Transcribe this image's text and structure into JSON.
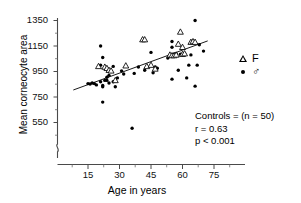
{
  "chart_data": {
    "type": "scatter",
    "title": "",
    "xlabel": "Age in years",
    "ylabel": "Mean corneocyte area",
    "xlim": [
      5,
      82
    ],
    "ylim": [
      490,
      1375
    ],
    "xticks": [
      15,
      30,
      45,
      60,
      75
    ],
    "yticks": [
      550,
      750,
      950,
      1150,
      1350
    ],
    "grid": false,
    "y_axis_break": true,
    "legend_position": "right-outside",
    "legend": [
      {
        "marker": "triangle",
        "label": "F"
      },
      {
        "marker": "dot",
        "label": "♂"
      }
    ],
    "annotations": [
      "Controls = (n = 50)",
      "r = 0.63",
      "p < 0.001"
    ],
    "regression_line": {
      "x_start": 8,
      "y_start": 805,
      "x_end": 72,
      "y_end": 1190
    },
    "series": [
      {
        "name": "Male",
        "marker": "dot",
        "points": [
          [
            15,
            855
          ],
          [
            16,
            852
          ],
          [
            17,
            860
          ],
          [
            18,
            855
          ],
          [
            19,
            845
          ],
          [
            21,
            1150
          ],
          [
            21,
            870
          ],
          [
            22,
            1060
          ],
          [
            22,
            840
          ],
          [
            22,
            830
          ],
          [
            22,
            710
          ],
          [
            23,
            880
          ],
          [
            24,
            905
          ],
          [
            24,
            880
          ],
          [
            25,
            860
          ],
          [
            26,
            950
          ],
          [
            27,
            990
          ],
          [
            27,
            870
          ],
          [
            28,
            830
          ],
          [
            29,
            900
          ],
          [
            31,
            955
          ],
          [
            32,
            930
          ],
          [
            36,
            505
          ],
          [
            37,
            935
          ],
          [
            39,
            985
          ],
          [
            42,
            960
          ],
          [
            45,
            1100
          ],
          [
            46,
            940
          ],
          [
            47,
            985
          ],
          [
            48,
            975
          ],
          [
            53,
            1055
          ],
          [
            55,
            1185
          ],
          [
            55,
            1140
          ],
          [
            55,
            890
          ],
          [
            56,
            1085
          ],
          [
            57,
            1090
          ],
          [
            58,
            960
          ],
          [
            59,
            1085
          ],
          [
            60,
            1085
          ],
          [
            61,
            1090
          ],
          [
            62,
            900
          ],
          [
            63,
            1000
          ],
          [
            64,
            1080
          ],
          [
            66,
            1350
          ],
          [
            66,
            835
          ],
          [
            67,
            1000
          ],
          [
            68,
            1160
          ],
          [
            70,
            1110
          ],
          [
            21,
            1000
          ],
          [
            25,
            920
          ]
        ]
      },
      {
        "name": "Female",
        "marker": "triangle",
        "points": [
          [
            20,
            990
          ],
          [
            23,
            985
          ],
          [
            24,
            975
          ],
          [
            25,
            960
          ],
          [
            26,
            955
          ],
          [
            28,
            880
          ],
          [
            33,
            995
          ],
          [
            41,
            1200
          ],
          [
            42,
            1200
          ],
          [
            43,
            990
          ],
          [
            45,
            1000
          ],
          [
            47,
            970
          ],
          [
            54,
            1080
          ],
          [
            55,
            1075
          ],
          [
            56,
            1075
          ],
          [
            57,
            1080
          ],
          [
            58,
            1165
          ],
          [
            59,
            1260
          ],
          [
            60,
            1140
          ],
          [
            60,
            1085
          ],
          [
            61,
            1090
          ],
          [
            64,
            1180
          ],
          [
            65,
            1185
          ],
          [
            66,
            1180
          ]
        ]
      }
    ]
  }
}
